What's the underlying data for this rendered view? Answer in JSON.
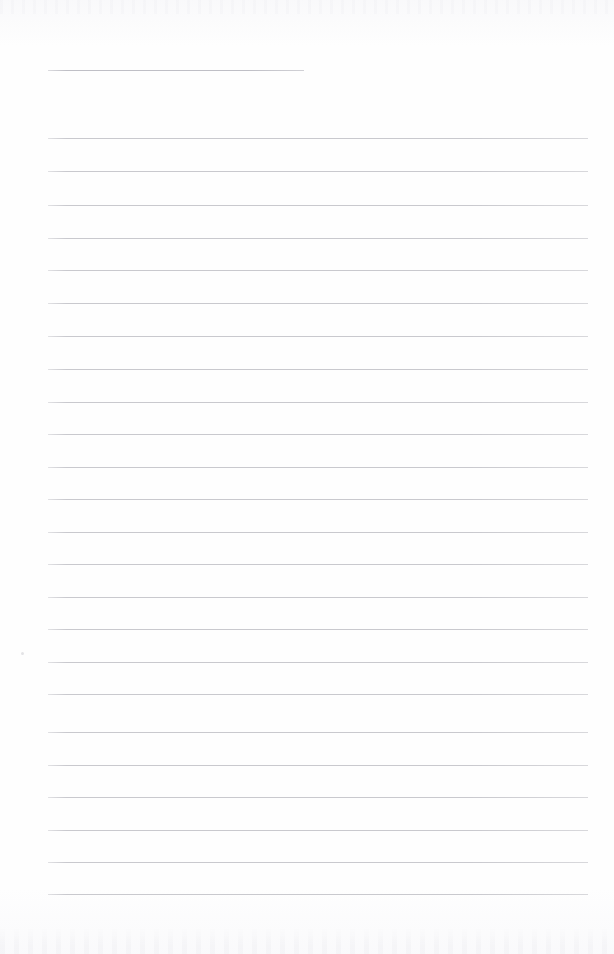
{
  "document": {
    "type": "lined-notebook-page",
    "title": "",
    "body_text": "",
    "background_color": "#fefefe",
    "rule_color": "#c9c9ce",
    "title_rule_color": "#bfbfc6",
    "page_width": 614,
    "page_height": 954,
    "is_blank": true
  },
  "title_rule": {
    "label": "",
    "x": 48,
    "y": 70,
    "width": 256
  },
  "rules": {
    "count": 24,
    "left": 48,
    "right": 588,
    "width": 540,
    "spacing": 32.5,
    "first_y": 138,
    "last_y": 894,
    "items": [
      {
        "index": 1,
        "y": 138
      },
      {
        "index": 2,
        "y": 171
      },
      {
        "index": 3,
        "y": 205
      },
      {
        "index": 4,
        "y": 238
      },
      {
        "index": 5,
        "y": 270
      },
      {
        "index": 6,
        "y": 303
      },
      {
        "index": 7,
        "y": 336
      },
      {
        "index": 8,
        "y": 369
      },
      {
        "index": 9,
        "y": 402
      },
      {
        "index": 10,
        "y": 434
      },
      {
        "index": 11,
        "y": 467
      },
      {
        "index": 12,
        "y": 499
      },
      {
        "index": 13,
        "y": 532
      },
      {
        "index": 14,
        "y": 564
      },
      {
        "index": 15,
        "y": 597
      },
      {
        "index": 16,
        "y": 629
      },
      {
        "index": 17,
        "y": 662
      },
      {
        "index": 18,
        "y": 694
      },
      {
        "index": 19,
        "y": 732
      },
      {
        "index": 20,
        "y": 765
      },
      {
        "index": 21,
        "y": 797
      },
      {
        "index": 22,
        "y": 830
      },
      {
        "index": 23,
        "y": 862
      },
      {
        "index": 24,
        "y": 894
      }
    ]
  },
  "marks": {
    "specks": [
      {
        "x": 21,
        "y": 652
      }
    ]
  }
}
